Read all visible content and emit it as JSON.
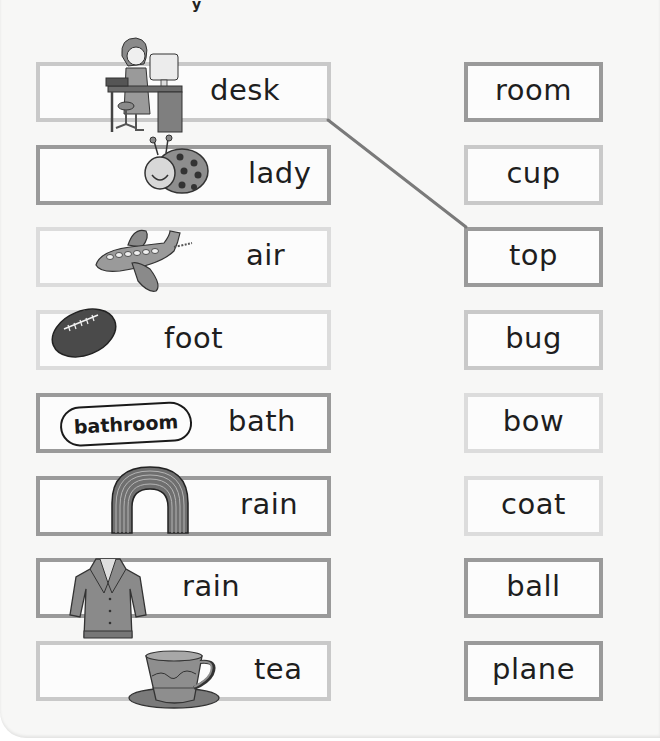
{
  "worksheet": {
    "top_fragment": "y",
    "left_items": [
      {
        "word": "desk",
        "picture": "woman-at-desk-icon"
      },
      {
        "word": "lady",
        "picture": "ladybug-icon"
      },
      {
        "word": "air",
        "picture": "airplane-icon"
      },
      {
        "word": "foot",
        "picture": "football-icon"
      },
      {
        "word": "bath",
        "picture": "bathroom-sign-icon",
        "picture_text": "bathroom"
      },
      {
        "word": "rain",
        "picture": "rainbow-icon"
      },
      {
        "word": "rain",
        "picture": "raincoat-icon"
      },
      {
        "word": "tea",
        "picture": "teacup-icon"
      }
    ],
    "right_items": [
      {
        "word": "room"
      },
      {
        "word": "cup"
      },
      {
        "word": "top"
      },
      {
        "word": "bug"
      },
      {
        "word": "bow"
      },
      {
        "word": "coat"
      },
      {
        "word": "ball"
      },
      {
        "word": "plane"
      }
    ],
    "connections": [
      {
        "from": "desk",
        "to": "top"
      }
    ],
    "colors": {
      "box_border": "#a9a9a9",
      "connector_line": "#7a7a7a",
      "text": "#1e1e1e",
      "background": "#f7f7f6"
    }
  }
}
